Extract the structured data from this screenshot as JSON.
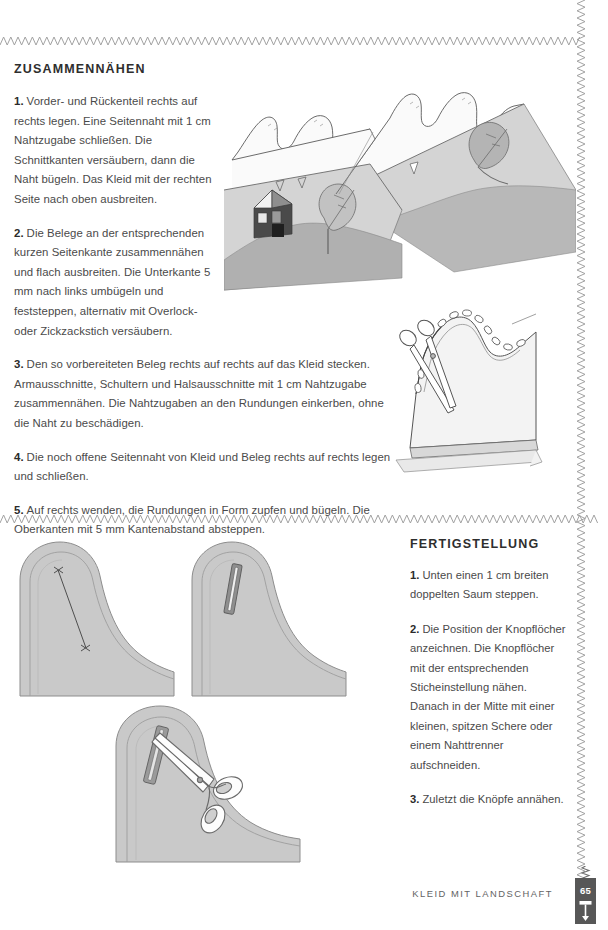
{
  "page": {
    "number": "65",
    "footer_title": "KLEID MIT LANDSCHAFT"
  },
  "sections": [
    {
      "id": "zusammennaehen",
      "title": "ZUSAMMENNÄHEN",
      "steps": [
        {
          "num": "1.",
          "text": "Vorder- und Rückenteil rechts auf rechts legen. Eine Seitennaht mit 1 cm Nahtzugabe schließen. Die Schnittkanten versäubern, dann die Naht bügeln. Das Kleid mit der rechten Seite nach oben ausbreiten."
        },
        {
          "num": "2.",
          "text": "Die Belege an der entsprechenden kurzen Seitenkante zusammennähen und flach ausbreiten. Die Unterkante 5 mm nach links umbügeln und feststeppen, alternativ mit Overlock- oder Zickzackstich versäubern."
        },
        {
          "num": "3.",
          "text": "Den so vorbereiteten Beleg rechts auf rechts auf das Kleid stecken. Armausschnitte, Schultern und Halsausschnitte mit 1 cm Nahtzugabe zusammennähen. Die Nahtzugaben an den Rundungen einkerben, ohne die Naht zu beschädigen."
        },
        {
          "num": "4.",
          "text": "Die noch offene Seitennaht von Kleid und Beleg rechts auf rechts legen und schließen."
        },
        {
          "num": "5.",
          "text": "Auf rechts wenden, die Rundungen in Form zupfen und bügeln. Die Oberkanten mit 5 mm Kantenabstand absteppen."
        }
      ]
    },
    {
      "id": "fertigstellung",
      "title": "FERTIGSTELLUNG",
      "steps": [
        {
          "num": "1.",
          "text": "Unten einen 1 cm breiten doppelten Saum steppen."
        },
        {
          "num": "2.",
          "text": "Die Position der Knopflöcher anzeichnen. Die Knopflöcher mit der entsprechenden Sticheinstellung nähen. Danach in der Mitte mit einer kleinen, spitzen Schere oder einem Nahttrenner aufschneiden."
        },
        {
          "num": "3.",
          "text": "Zuletzt die Knöpfe annähen."
        }
      ]
    }
  ],
  "illustrations": [
    {
      "id": "dress-landscape",
      "name": "dress-landscape-illustration",
      "caption": "Kleid mit Landschaftsapplikation flach ausgebreitet"
    },
    {
      "id": "facing-pinned",
      "name": "facing-pinned-illustration",
      "caption": "Beleg mit Stecknadeln und Schere am Armausschnitt"
    },
    {
      "id": "buttonhole-marking",
      "name": "buttonhole-marking-illustration",
      "caption": "Saumecke mit angezeichneter Knopflochposition"
    },
    {
      "id": "buttonhole-stitched",
      "name": "buttonhole-stitched-illustration",
      "caption": "Genähtes Knopfloch in der Saumecke"
    },
    {
      "id": "buttonhole-cutting",
      "name": "buttonhole-cutting-illustration",
      "caption": "Knopfloch mit der Schere aufschneiden"
    }
  ],
  "colors": {
    "ink": "#3c3c3c",
    "heading": "#2e2e2e",
    "body": "#4a4a4a",
    "zigzag": "#9a9a9a",
    "badge": "#575757",
    "fabric_light": "#f2f2f2",
    "fabric_mid": "#cfcfcf",
    "fabric_dark": "#b0b0b0",
    "outline": "#555555"
  }
}
